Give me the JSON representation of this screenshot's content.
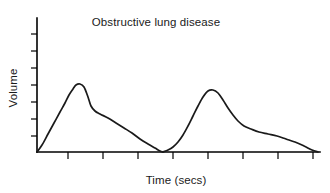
{
  "chart_data": {
    "type": "line",
    "title": "Obstructive lung disease",
    "xlabel": "Time (secs)",
    "ylabel": "Volume",
    "grid": false,
    "legend": null,
    "axes": {
      "x_ticks_count": 8,
      "y_ticks_count": 7,
      "x_tick_labels": [],
      "y_tick_labels": [],
      "xlim": [
        0,
        10
      ],
      "ylim": [
        0,
        10
      ],
      "origin_px": [
        37,
        152
      ],
      "x_axis_end_px": [
        320,
        152
      ],
      "y_axis_top_px": [
        37,
        18
      ]
    },
    "series": [
      {
        "name": "breath-1",
        "peak_x": 76,
        "peak_y": 85,
        "start_x": 37,
        "end_x": 163,
        "points": [
          [
            37,
            152
          ],
          [
            42,
            145
          ],
          [
            48,
            134
          ],
          [
            54,
            123
          ],
          [
            60,
            112
          ],
          [
            65,
            103
          ],
          [
            69,
            95
          ],
          [
            73,
            89
          ],
          [
            76,
            85
          ],
          [
            80,
            84
          ],
          [
            84,
            87
          ],
          [
            88,
            97
          ],
          [
            91,
            106
          ],
          [
            95,
            111
          ],
          [
            100,
            114
          ],
          [
            108,
            118
          ],
          [
            116,
            123
          ],
          [
            124,
            128
          ],
          [
            132,
            133
          ],
          [
            140,
            139
          ],
          [
            148,
            144
          ],
          [
            155,
            148
          ],
          [
            160,
            151
          ],
          [
            163,
            152
          ]
        ]
      },
      {
        "name": "breath-2",
        "peak_x": 208,
        "peak_y": 90,
        "start_x": 163,
        "end_x": 318,
        "points": [
          [
            163,
            152
          ],
          [
            168,
            150
          ],
          [
            173,
            147
          ],
          [
            178,
            142
          ],
          [
            183,
            135
          ],
          [
            188,
            126
          ],
          [
            193,
            116
          ],
          [
            198,
            106
          ],
          [
            203,
            97
          ],
          [
            208,
            91
          ],
          [
            213,
            90
          ],
          [
            218,
            93
          ],
          [
            223,
            100
          ],
          [
            228,
            108
          ],
          [
            233,
            115
          ],
          [
            238,
            121
          ],
          [
            244,
            126
          ],
          [
            251,
            129
          ],
          [
            259,
            132
          ],
          [
            268,
            134
          ],
          [
            277,
            136
          ],
          [
            286,
            139
          ],
          [
            295,
            142
          ],
          [
            304,
            146
          ],
          [
            312,
            150
          ],
          [
            318,
            152
          ]
        ]
      }
    ]
  }
}
